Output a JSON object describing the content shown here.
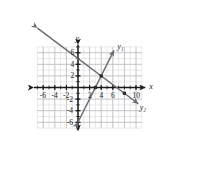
{
  "figure": {
    "type": "cartesian-line-graph",
    "background": "#ffffff",
    "grid_color": "#d8d8dc",
    "grid_major_color": "#bdbdc4",
    "axis_color": "#1a1a1a",
    "line_color": "#6b6b70",
    "point_color": "#2a2a2a"
  },
  "axes": {
    "x_label": "x",
    "y_label": "y",
    "x_min": -7.6,
    "x_max": 11.6,
    "y_min": -7.4,
    "y_max": 7.4,
    "x_ticks": [
      -6,
      -4,
      -2,
      2,
      4,
      6,
      10
    ],
    "y_ticks": [
      6,
      4,
      2,
      -2,
      -4,
      -6
    ],
    "x_tick_labels": [
      "-6",
      "-4",
      "-2",
      "2",
      "4",
      "6",
      "10"
    ],
    "y_tick_labels": [
      "6",
      "4",
      "2",
      "-2",
      "-4",
      "-6"
    ],
    "unit_px": 5.8,
    "origin_px": {
      "x": 78,
      "y": 87.5
    },
    "grid_step": 1,
    "grid_major_step": 2,
    "grid_bounds": {
      "x_min": -7,
      "x_max": 11,
      "y_min": -7,
      "y_max": 7
    }
  },
  "chart_data": {
    "type": "line",
    "title": "",
    "xlabel": "x",
    "ylabel": "y",
    "xlim": [
      -7.6,
      11.6
    ],
    "ylim": [
      -7.4,
      7.4
    ],
    "grid": true,
    "legend": "inline-end-labels",
    "series": [
      {
        "name": "y1",
        "label": "y₁",
        "equation": "y = 2x - 6",
        "slope": 2,
        "intercept": -6,
        "x_intercept": 3,
        "draw_from": {
          "x": 0,
          "y": -6
        },
        "draw_to": {
          "x": 6.2,
          "y": 6.4
        },
        "label_pos": {
          "x": 7.1,
          "y": 6.9
        },
        "arrow_start": true,
        "arrow_end": true
      },
      {
        "name": "y2",
        "label": "y₂",
        "equation": "y = -0.75x + 5",
        "slope": -0.75,
        "intercept": 5,
        "x_intercept": 6.667,
        "draw_from": {
          "x": -7.0,
          "y": 10.25
        },
        "draw_to": {
          "x": 10.4,
          "y": -2.8
        },
        "label_pos": {
          "x": 11.0,
          "y": -3.5
        },
        "arrow_start": true,
        "arrow_end": true
      }
    ],
    "marked_points": [
      {
        "x": 4,
        "y": 2,
        "name": "intersection-point"
      },
      {
        "x": 3,
        "y": 0,
        "name": "y1-x-intercept-point"
      },
      {
        "x": 8,
        "y": -1,
        "name": "y2-point"
      }
    ]
  }
}
